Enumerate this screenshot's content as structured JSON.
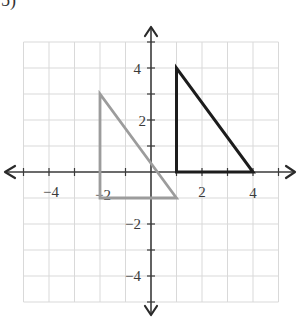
{
  "problem": {
    "label": "5)"
  },
  "plane": {
    "x_range": [
      -5,
      5
    ],
    "y_range": [
      -5,
      5
    ],
    "grid": true,
    "grid_color": "#d9d9d9",
    "axis_color": "#3a3a3a",
    "x_tick_labels": [
      "-4",
      "-2",
      "2",
      "4"
    ],
    "y_tick_labels": [
      "4",
      "2",
      "-2",
      "-4"
    ]
  },
  "figures": [
    {
      "name": "original-triangle",
      "color": "#9c9c9c",
      "vertices": [
        [
          -2,
          3
        ],
        [
          -2,
          -1
        ],
        [
          1,
          -1
        ]
      ]
    },
    {
      "name": "image-triangle",
      "color": "#1c1c1c",
      "vertices": [
        [
          1,
          4
        ],
        [
          1,
          0
        ],
        [
          4,
          0
        ]
      ]
    }
  ],
  "labels": {
    "x_neg4": "−4",
    "x_neg2": "−2",
    "x_pos2": "2",
    "x_pos4": "4",
    "y_pos4": "4",
    "y_pos2": "2",
    "y_neg2": "−2",
    "y_neg4": "−4"
  }
}
